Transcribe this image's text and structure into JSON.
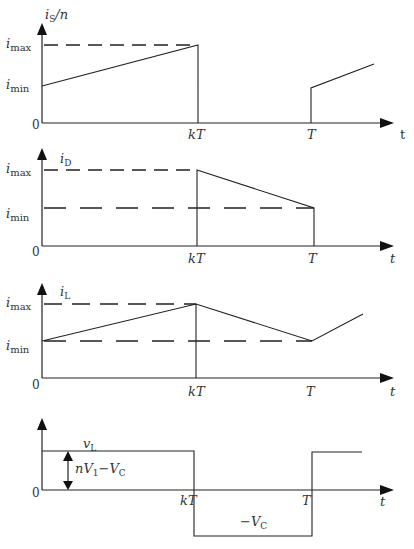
{
  "figure": {
    "panels": [
      {
        "id": "is",
        "y_label": "i_S/n",
        "y_label_main": "i",
        "y_label_sub": "S",
        "y_label_suffix": "/n",
        "ticks": {
          "max": "i",
          "max_sub": "max",
          "min": "i",
          "min_sub": "min",
          "zero": "0"
        },
        "x_ticks": {
          "kT": "kT",
          "T": "T"
        },
        "x_label": "t"
      },
      {
        "id": "id",
        "y_label_main": "i",
        "y_label_sub": "D",
        "ticks": {
          "max": "i",
          "max_sub": "max",
          "min": "i",
          "min_sub": "min",
          "zero": "0"
        },
        "x_ticks": {
          "kT": "kT",
          "T": "T"
        },
        "x_label": "t"
      },
      {
        "id": "il",
        "y_label_main": "i",
        "y_label_sub": "L",
        "ticks": {
          "max": "i",
          "max_sub": "max",
          "min": "i",
          "min_sub": "min",
          "zero": "0"
        },
        "x_ticks": {
          "kT": "kT",
          "T": "T"
        },
        "x_label": "t"
      },
      {
        "id": "vl",
        "y_label_main": "v",
        "y_label_sub": "L",
        "ticks": {
          "zero": "0"
        },
        "x_ticks": {
          "kT": "kT",
          "T": "T"
        },
        "x_label": "t",
        "annotation_high": {
          "n": "n",
          "V": "V",
          "sub1": "1",
          "minus": "−",
          "V2": "V",
          "sub2": "C"
        },
        "annotation_low": {
          "minus": "−",
          "V": "V",
          "sub": "C"
        }
      }
    ]
  }
}
